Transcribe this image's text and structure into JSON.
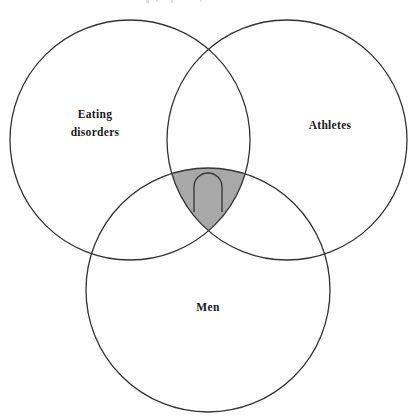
{
  "figure": {
    "type": "venn",
    "background_color": "#ffffff",
    "width": 419,
    "height": 419
  },
  "sets": [
    {
      "key": "eating_disorders",
      "label_line_1": "Eating",
      "label_line_2": "disorders",
      "label_full": "Eating disorders",
      "center_x": 130,
      "center_y": 140,
      "radius": 120,
      "label_x": 95,
      "label_y": 118,
      "stroke_color": "#333333",
      "fill_color": "none"
    },
    {
      "key": "athletes",
      "label_line_1": "Athletes",
      "label_line_2": "",
      "label_full": "Athletes",
      "center_x": 287,
      "center_y": 140,
      "radius": 120,
      "label_x": 330,
      "label_y": 129,
      "stroke_color": "#333333",
      "fill_color": "none"
    },
    {
      "key": "men",
      "label_line_1": "Men",
      "label_line_2": "",
      "label_full": "Men",
      "center_x": 208,
      "center_y": 290,
      "radius": 122,
      "label_x": 208,
      "label_y": 311,
      "stroke_color": "#333333",
      "fill_color": "none"
    }
  ],
  "intersection": {
    "name": "triple-intersection",
    "description": "Eating disorders AND Athletes AND Men",
    "fill_color": "#a8a8a8",
    "symbol": "intersection-symbol",
    "symbol_char": "∩",
    "symbol_x": 208,
    "symbol_y": 196,
    "symbol_stroke_color": "#3a3a3a"
  },
  "chart_data": {
    "type": "venn",
    "title": "",
    "set_labels": [
      "Eating disorders",
      "Athletes",
      "Men"
    ],
    "highlighted_region": "Eating disorders ∩ Athletes ∩ Men",
    "highlight_color": "#a8a8a8",
    "region_annotation": "∩"
  }
}
